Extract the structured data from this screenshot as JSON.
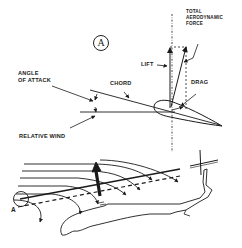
{
  "figure": {
    "panel_label": "A",
    "airfoil_labels": {
      "total_aerodynamic_force_line1": "TOTAL",
      "total_aerodynamic_force_line2": "AERODYNAMIC",
      "total_aerodynamic_force_line3": "FORCE",
      "lift": "LIFT",
      "drag": "DRAG",
      "chord": "CHORD",
      "angle_of_attack_line1": "ANGLE",
      "angle_of_attack_line2": "OF ATTACK",
      "relative_wind": "RELATIVE WIND"
    },
    "helicopter_labels": {
      "detail_marker": "A"
    },
    "colors": {
      "ink": "#1a1a1a",
      "background": "#ffffff"
    }
  }
}
